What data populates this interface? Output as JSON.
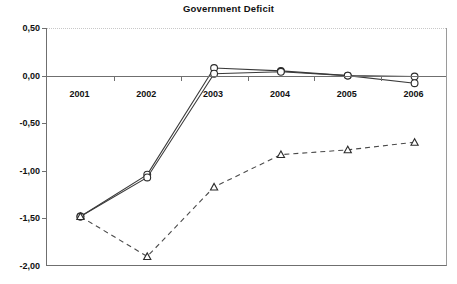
{
  "chart_data": {
    "type": "line",
    "title": "Government Deficit",
    "xlabel": "",
    "ylabel": "",
    "categories": [
      "2001",
      "2002",
      "2003",
      "2004",
      "2005",
      "2006"
    ],
    "ylim": [
      -2.0,
      0.5
    ],
    "yticks": [
      0.5,
      0.0,
      -0.5,
      -1.0,
      -1.5,
      -2.0
    ],
    "ytick_labels": [
      "0,50",
      "0,00",
      "-0,50",
      "-1,00",
      "-1,50",
      "-2,00"
    ],
    "grid": "horizontal-dotted-at-0,50",
    "legend": "none",
    "decimal_separator": ",",
    "series": [
      {
        "name": "series-1",
        "marker": "circle",
        "line_style": "solid",
        "values": [
          -1.48,
          -1.04,
          0.08,
          0.05,
          0.0,
          -0.01
        ]
      },
      {
        "name": "series-2",
        "marker": "circle",
        "line_style": "solid",
        "values": [
          -1.48,
          -1.07,
          0.02,
          0.04,
          0.0,
          -0.08
        ]
      },
      {
        "name": "series-3",
        "marker": "triangle",
        "line_style": "dashed",
        "values": [
          -1.48,
          -1.9,
          -1.17,
          -0.83,
          -0.78,
          -0.7
        ]
      }
    ]
  },
  "colors": {
    "axis": "#6f6f6f",
    "grid": "#c8c8c8",
    "line": "#3a3a3a",
    "marker_fill": "#ffffff",
    "marker_stroke": "#2b2b2b",
    "background": "#ffffff",
    "text": "#111111"
  }
}
